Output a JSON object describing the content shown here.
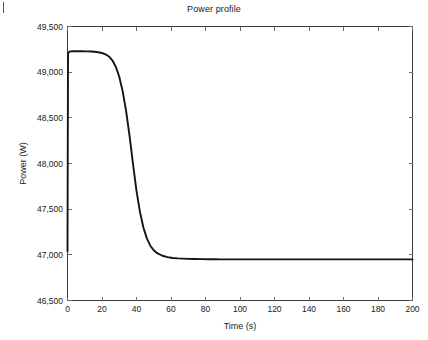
{
  "figure": {
    "background": "#ffffff",
    "axis_color": "#3a3a3a",
    "line_color": "#141414"
  },
  "artifacts": {
    "left_edge_mark": ""
  },
  "chart_data": {
    "type": "line",
    "title": "Power profile",
    "xlabel": "Time (s)",
    "ylabel": "Power (W)",
    "xlim": [
      0,
      200
    ],
    "ylim": [
      46500,
      49500
    ],
    "xticks": [
      0,
      20,
      40,
      60,
      80,
      100,
      120,
      140,
      160,
      180,
      200
    ],
    "xticklabels": [
      "0",
      "20",
      "40",
      "60",
      "80",
      "100",
      "120",
      "140",
      "160",
      "180",
      "200"
    ],
    "yticks": [
      46500,
      47000,
      47500,
      48000,
      48500,
      49000,
      49500
    ],
    "yticklabels": [
      "46,500",
      "47,000",
      "47,500",
      "48,000",
      "48,500",
      "49,000",
      "49,500"
    ],
    "grid": false,
    "legend": null,
    "box": true,
    "tick_direction": "in",
    "series": [
      {
        "name": "Power",
        "x": [
          0,
          0.3,
          1,
          2,
          3,
          5,
          8,
          11,
          14,
          17,
          20,
          22,
          24,
          26,
          28,
          30,
          32,
          34,
          36,
          38,
          40,
          42,
          44,
          46,
          48,
          50,
          52,
          55,
          58,
          61,
          64,
          67,
          70,
          74,
          78,
          82,
          86,
          88,
          92,
          100,
          110,
          120,
          140,
          160,
          180,
          200
        ],
        "y": [
          47040,
          49200,
          49225,
          49228,
          49229,
          49229,
          49229,
          49228,
          49226,
          49221,
          49210,
          49196,
          49172,
          49130,
          49060,
          48950,
          48790,
          48570,
          48300,
          47990,
          47700,
          47470,
          47300,
          47180,
          47100,
          47050,
          47018,
          46990,
          46975,
          46966,
          46961,
          46958,
          46956,
          46954,
          46953,
          46952,
          46951,
          46950,
          46950,
          46950,
          46950,
          46950,
          46950,
          46950,
          46950,
          46950
        ]
      }
    ]
  }
}
